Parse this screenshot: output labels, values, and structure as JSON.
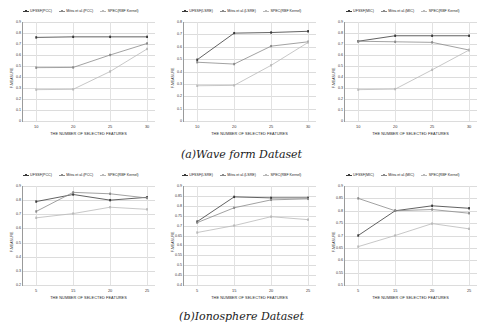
{
  "figure": {
    "captions": [
      {
        "id": "a",
        "text": "(a)Wave form Dataset"
      },
      {
        "id": "b",
        "text": "(b)Ionosphere Dataset"
      }
    ]
  },
  "colors": {
    "ufsf": "#3a3a3a",
    "mitra": "#8a8a8a",
    "spec": "#b9b9b9",
    "grid": "#dcdcdc",
    "axis": "#9a9a9a",
    "background": "#ffffff"
  },
  "chart_data": [
    {
      "id": "waveform-pcc",
      "type": "line",
      "title": "",
      "xlabel": "THE NUMBER OF SELECTED FEATURES",
      "ylabel": "F-MEASURE",
      "categories": [
        10,
        20,
        25,
        30
      ],
      "x": [
        10,
        20,
        25,
        30
      ],
      "xticklabels": [
        "10",
        "20",
        "25",
        "30"
      ],
      "yticklabels": [
        "0",
        "0.1",
        "0.2",
        "0.3",
        "0.4",
        "0.5",
        "0.6",
        "0.7",
        "0.8",
        "0.9"
      ],
      "ylim": [
        0,
        0.9
      ],
      "ytickvalues": [
        0,
        0.1,
        0.2,
        0.3,
        0.4,
        0.5,
        0.6,
        0.7,
        0.8,
        0.9
      ],
      "grid": true,
      "legend_position": "top",
      "series": [
        {
          "name": "UFSSF(PCC)",
          "values": [
            0.76,
            0.765,
            0.765,
            0.765
          ]
        },
        {
          "name": "Mitra et al.(PCC)",
          "values": [
            0.485,
            0.487,
            0.6,
            0.705
          ]
        },
        {
          "name": "SPEC(RBF Kernel)",
          "values": [
            0.285,
            0.288,
            0.45,
            0.655
          ]
        }
      ]
    },
    {
      "id": "waveform-lsre",
      "type": "line",
      "title": "",
      "xlabel": "THE NUMBER OF SELECTED FEATURES",
      "ylabel": "F-MEASURE",
      "categories": [
        10,
        20,
        25,
        30
      ],
      "x": [
        10,
        20,
        25,
        30
      ],
      "xticklabels": [
        "10",
        "20",
        "25",
        "30"
      ],
      "yticklabels": [
        "0",
        "0.1",
        "0.2",
        "0.3",
        "0.4",
        "0.5",
        "0.6",
        "0.7",
        "0.8"
      ],
      "ylim": [
        0,
        0.8
      ],
      "ytickvalues": [
        0,
        0.1,
        0.2,
        0.3,
        0.4,
        0.5,
        0.6,
        0.7,
        0.8
      ],
      "grid": true,
      "legend_position": "top",
      "series": [
        {
          "name": "UFSSF(LSRE)",
          "values": [
            0.495,
            0.71,
            0.715,
            0.725
          ]
        },
        {
          "name": "Mitra et al.(LSRE)",
          "values": [
            0.475,
            0.46,
            0.605,
            0.64
          ]
        },
        {
          "name": "SPEC(RBF Kernel)",
          "values": [
            0.285,
            0.288,
            0.45,
            0.635
          ]
        }
      ]
    },
    {
      "id": "waveform-mic",
      "type": "line",
      "title": "",
      "xlabel": "THE NUMBER OF SELECTED FEATURES",
      "ylabel": "F-MEASURE",
      "categories": [
        10,
        20,
        25,
        30
      ],
      "x": [
        10,
        20,
        25,
        30
      ],
      "xticklabels": [
        "10",
        "20",
        "25",
        "30"
      ],
      "yticklabels": [
        "0",
        "0.1",
        "0.2",
        "0.3",
        "0.4",
        "0.5",
        "0.6",
        "0.7",
        "0.8",
        "0.9"
      ],
      "ylim": [
        0,
        0.9
      ],
      "ytickvalues": [
        0,
        0.1,
        0.2,
        0.3,
        0.4,
        0.5,
        0.6,
        0.7,
        0.8,
        0.9
      ],
      "grid": true,
      "legend_position": "top",
      "series": [
        {
          "name": "UFSSF(MIC)",
          "values": [
            0.725,
            0.775,
            0.775,
            0.775
          ]
        },
        {
          "name": "Mitra et al.(MIC)",
          "values": [
            0.725,
            0.72,
            0.715,
            0.645
          ]
        },
        {
          "name": "SPEC(RBF Kernel)",
          "values": [
            0.285,
            0.29,
            0.465,
            0.645
          ]
        }
      ]
    },
    {
      "id": "ionosphere-pcc",
      "type": "line",
      "title": "",
      "xlabel": "THE NUMBER OF SELECTED FEATURES",
      "ylabel": "F-MEASURE",
      "categories": [
        5,
        15,
        20,
        25
      ],
      "x": [
        5,
        15,
        20,
        25
      ],
      "xticklabels": [
        "5",
        "15",
        "20",
        "25"
      ],
      "yticklabels": [
        "0.2",
        "0.3",
        "0.4",
        "0.5",
        "0.6",
        "0.7",
        "0.8",
        "0.9"
      ],
      "ylim": [
        0.2,
        0.9
      ],
      "ytickvalues": [
        0.2,
        0.3,
        0.4,
        0.5,
        0.6,
        0.7,
        0.8,
        0.9
      ],
      "grid": true,
      "legend_position": "top",
      "series": [
        {
          "name": "UFSSF(PCC)",
          "values": [
            0.79,
            0.84,
            0.8,
            0.82
          ]
        },
        {
          "name": "Mitra et al.(PCC)",
          "values": [
            0.72,
            0.855,
            0.845,
            0.815
          ]
        },
        {
          "name": "SPEC(RBF Kernel)",
          "values": [
            0.675,
            0.705,
            0.75,
            0.735
          ]
        }
      ]
    },
    {
      "id": "ionosphere-lsre",
      "type": "line",
      "title": "",
      "xlabel": "THE NUMBER OF SELECTED FEATURES",
      "ylabel": "F-MEASURE",
      "categories": [
        5,
        15,
        20,
        25
      ],
      "x": [
        5,
        15,
        20,
        25
      ],
      "xticklabels": [
        "5",
        "15",
        "20",
        "25"
      ],
      "yticklabels": [
        "0.4",
        "0.45",
        "0.5",
        "0.55",
        "0.6",
        "0.65",
        "0.7",
        "0.75",
        "0.8",
        "0.85",
        "0.9"
      ],
      "ylim": [
        0.4,
        0.9
      ],
      "ytickvalues": [
        0.4,
        0.45,
        0.5,
        0.55,
        0.6,
        0.65,
        0.7,
        0.75,
        0.8,
        0.85,
        0.9
      ],
      "grid": true,
      "legend_position": "top",
      "series": [
        {
          "name": "UFSSF(LSRE)",
          "values": [
            0.72,
            0.845,
            0.84,
            0.84
          ]
        },
        {
          "name": "Mitra et al.(LSRE)",
          "values": [
            0.715,
            0.79,
            0.83,
            0.835
          ]
        },
        {
          "name": "SPEC(RBF Kernel)",
          "values": [
            0.665,
            0.7,
            0.745,
            0.73
          ]
        }
      ]
    },
    {
      "id": "ionosphere-mic",
      "type": "line",
      "title": "",
      "xlabel": "THE NUMBER OF SELECTED FEATURES",
      "ylabel": "F-MEASURE",
      "categories": [
        5,
        15,
        20,
        25
      ],
      "x": [
        5,
        15,
        20,
        25
      ],
      "xticklabels": [
        "5",
        "15",
        "20",
        "25"
      ],
      "yticklabels": [
        "0.5",
        "0.55",
        "0.6",
        "0.65",
        "0.7",
        "0.75",
        "0.8",
        "0.85",
        "0.9"
      ],
      "ylim": [
        0.5,
        0.9
      ],
      "ytickvalues": [
        0.5,
        0.55,
        0.6,
        0.65,
        0.7,
        0.75,
        0.8,
        0.85,
        0.9
      ],
      "grid": true,
      "legend_position": "top",
      "series": [
        {
          "name": "UFSSF(MIC)",
          "values": [
            0.7,
            0.8,
            0.82,
            0.81
          ]
        },
        {
          "name": "Mitra et al.(MIC)",
          "values": [
            0.85,
            0.8,
            0.805,
            0.79
          ]
        },
        {
          "name": "SPEC(RBF Kernel)",
          "values": [
            0.655,
            0.7,
            0.748,
            0.727
          ]
        }
      ]
    }
  ]
}
